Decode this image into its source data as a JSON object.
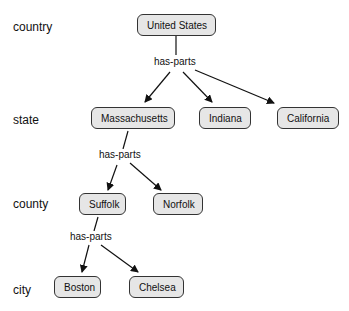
{
  "levels": [
    {
      "label": "country"
    },
    {
      "label": "state"
    },
    {
      "label": "county"
    },
    {
      "label": "city"
    }
  ],
  "nodes": {
    "united_states": "United States",
    "massachusetts": "Massachusetts",
    "indiana": "Indiana",
    "california": "California",
    "suffolk": "Suffolk",
    "norfolk": "Norfolk",
    "boston": "Boston",
    "chelsea": "Chelsea"
  },
  "relations": {
    "us_parts": "has-parts",
    "ma_parts": "has-parts",
    "suffolk_parts": "has-parts"
  },
  "colors": {
    "node_fill": "#e6e6e6",
    "node_border": "#333333",
    "edge": "#111111"
  }
}
